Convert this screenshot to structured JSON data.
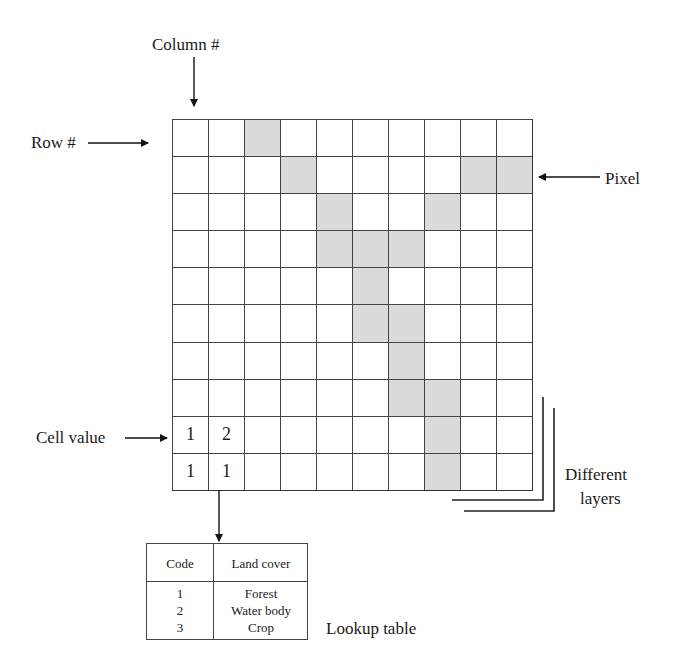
{
  "labels": {
    "column": "Column #",
    "row": "Row #",
    "pixel": "Pixel",
    "cell_value": "Cell value",
    "layers_line1": "Different",
    "layers_line2": "layers",
    "lookup_caption": "Lookup table"
  },
  "grid": {
    "rows": 10,
    "cols": 10,
    "shaded_color": "#dadada",
    "shaded_cells": [
      [
        0,
        2
      ],
      [
        1,
        3
      ],
      [
        1,
        8
      ],
      [
        1,
        9
      ],
      [
        2,
        4
      ],
      [
        2,
        7
      ],
      [
        3,
        4
      ],
      [
        3,
        5
      ],
      [
        3,
        6
      ],
      [
        4,
        5
      ],
      [
        5,
        5
      ],
      [
        5,
        6
      ],
      [
        6,
        6
      ],
      [
        7,
        6
      ],
      [
        7,
        7
      ],
      [
        8,
        7
      ],
      [
        9,
        7
      ]
    ],
    "cell_values": [
      {
        "row": 8,
        "col": 0,
        "value": "1"
      },
      {
        "row": 8,
        "col": 1,
        "value": "2"
      },
      {
        "row": 9,
        "col": 0,
        "value": "1"
      },
      {
        "row": 9,
        "col": 1,
        "value": "1"
      }
    ]
  },
  "lookup_table": {
    "headers": [
      "Code",
      "Land cover"
    ],
    "rows": [
      {
        "code": "1",
        "cover": "Forest"
      },
      {
        "code": "2",
        "cover": "Water body"
      },
      {
        "code": "3",
        "cover": "Crop"
      }
    ]
  }
}
